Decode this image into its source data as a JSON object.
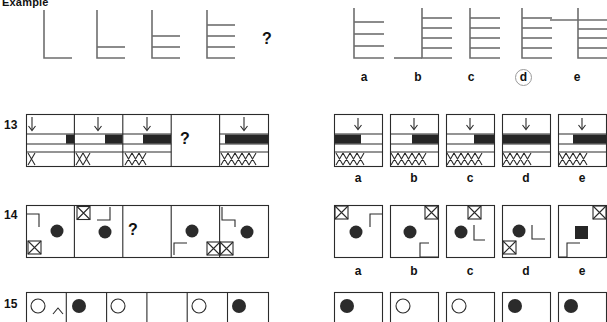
{
  "page": {
    "title": "Example",
    "background": "#ffffff",
    "ink": "#2b2b2b",
    "ladder_color": "#6e6e6e",
    "fill_color": "#262626",
    "circle_highlight_color": "#9a9a9a",
    "question_mark": "?",
    "width": 607,
    "height": 316
  },
  "example": {
    "label": "Example",
    "type": "ladder-sequence",
    "prompt_figures": [
      {
        "rungs": 0,
        "has_foot": true
      },
      {
        "rungs": 1,
        "has_foot": true
      },
      {
        "rungs": 2,
        "has_foot": true
      },
      {
        "rungs": 3,
        "has_foot": true
      },
      {
        "rungs": null,
        "is_question": true
      }
    ],
    "options": [
      {
        "id": "a",
        "label": "a",
        "rungs": 3,
        "stem_top": "above",
        "selected": false
      },
      {
        "id": "b",
        "label": "b",
        "rungs": 4,
        "stem_top": "above",
        "selected": false
      },
      {
        "id": "c",
        "label": "c",
        "rungs": 4,
        "stem_top": "above",
        "selected": false
      },
      {
        "id": "d",
        "label": "d",
        "rungs": 4,
        "stem_top": "above",
        "selected": true
      },
      {
        "id": "e",
        "label": "e",
        "rungs": 4,
        "stem_top": "crossed",
        "selected": false
      }
    ],
    "selected_option": "d"
  },
  "questions": [
    {
      "number": "13",
      "type": "arrow-bar-xmarks",
      "prompt_cells": [
        {
          "arrow": true,
          "bar_fill_fraction": 0.17,
          "x_count": 1
        },
        {
          "arrow": true,
          "bar_fill_fraction": 0.36,
          "x_count": 2
        },
        {
          "arrow": true,
          "bar_fill_fraction": 0.58,
          "x_count": 3
        },
        {
          "is_question": true
        },
        {
          "arrow": true,
          "bar_fill_fraction": 0.88,
          "x_count": 5
        }
      ],
      "options": [
        {
          "id": "a",
          "label": "a",
          "bar_fill_fraction": 0.55,
          "bar_fill_side": "left",
          "x_count": 4
        },
        {
          "id": "b",
          "label": "b",
          "bar_fill_fraction": 0.55,
          "bar_fill_side": "right",
          "x_count": 5
        },
        {
          "id": "c",
          "label": "c",
          "bar_fill_fraction": 0.42,
          "bar_fill_side": "right",
          "x_count": 5
        },
        {
          "id": "d",
          "label": "d",
          "bar_fill_fraction": 1.0,
          "bar_fill_side": "full",
          "x_count": 4
        },
        {
          "id": "e",
          "label": "e",
          "bar_fill_fraction": 0.72,
          "bar_fill_side": "right",
          "x_count": 4
        }
      ]
    },
    {
      "number": "14",
      "type": "box-dot-xmark",
      "prompt_cells": [
        {
          "dot": "circle",
          "xmark_pos": "bottom-left",
          "bracket": "top-left"
        },
        {
          "dot": "circle",
          "xmark_pos": "top-left",
          "bracket": "top-right"
        },
        {
          "is_question": true
        },
        {
          "dot": "circle",
          "xmark_pos": "none",
          "bracket": "bottom-left"
        },
        {
          "dot": "circle",
          "xmark_pos": "bottom-left-double",
          "bracket": "top-left"
        }
      ],
      "options": [
        {
          "id": "a",
          "label": "a",
          "shape": "circle",
          "xmark_pos": "top-left",
          "bracket": "top-right"
        },
        {
          "id": "b",
          "label": "b",
          "shape": "circle",
          "xmark_pos": "top-right",
          "bracket": "bottom-right"
        },
        {
          "id": "c",
          "label": "c",
          "shape": "circle",
          "xmark_pos": "top-right",
          "bracket": "middle-right"
        },
        {
          "id": "d",
          "label": "d",
          "shape": "circle",
          "xmark_pos": "bottom-left",
          "bracket": "middle-right"
        },
        {
          "id": "e",
          "label": "e",
          "shape": "square",
          "xmark_pos": "top-right",
          "bracket": "bottom-left"
        }
      ]
    },
    {
      "number": "15",
      "type": "circle-dot-row",
      "clipped": true,
      "prompt_cells": [
        {
          "dot": "hollow"
        },
        {
          "dot": "filled"
        },
        {
          "dot": "hollow"
        },
        {
          "dot": "none"
        },
        {
          "dot": "hollow"
        },
        {
          "dot": "filled"
        }
      ],
      "options": [
        {
          "id": "a",
          "label": "a",
          "dot": "filled"
        },
        {
          "id": "b",
          "label": "b",
          "dot": "hollow"
        },
        {
          "id": "c",
          "label": "c",
          "dot": "hollow"
        },
        {
          "id": "d",
          "label": "d",
          "dot": "filled"
        },
        {
          "id": "e",
          "label": "e",
          "dot": "filled"
        }
      ]
    }
  ]
}
